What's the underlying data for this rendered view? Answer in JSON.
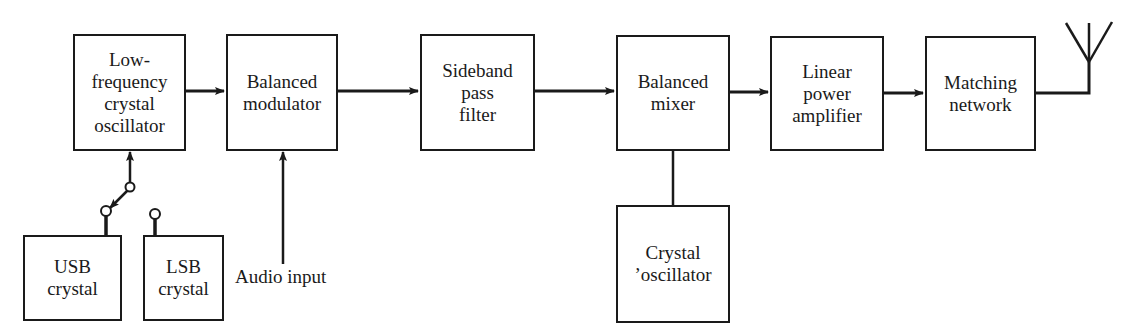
{
  "diagram": {
    "blocks": [
      {
        "id": "lf_osc",
        "lines": [
          "Low-",
          "frequency",
          "crystal",
          "oscillator"
        ]
      },
      {
        "id": "bal_mod",
        "lines": [
          "Balanced",
          "modulator"
        ]
      },
      {
        "id": "sb_filter",
        "lines": [
          "Sideband",
          "pass",
          "filter"
        ]
      },
      {
        "id": "bal_mixer",
        "lines": [
          "Balanced",
          "mixer"
        ]
      },
      {
        "id": "lin_amp",
        "lines": [
          "Linear",
          "power",
          "amplifier"
        ]
      },
      {
        "id": "match_net",
        "lines": [
          "Matching",
          "network"
        ]
      },
      {
        "id": "usb_crystal",
        "lines": [
          "USB",
          "crystal"
        ]
      },
      {
        "id": "lsb_crystal",
        "lines": [
          "LSB",
          "crystal"
        ]
      },
      {
        "id": "crystal_osc",
        "lines": [
          "Crystal",
          "’oscillator"
        ]
      }
    ],
    "labels": {
      "audio_input": "Audio input"
    },
    "connections": [
      {
        "from": "lf_osc",
        "to": "bal_mod",
        "arrow": true
      },
      {
        "from": "bal_mod",
        "to": "sb_filter",
        "arrow": true
      },
      {
        "from": "sb_filter",
        "to": "bal_mixer",
        "arrow": true
      },
      {
        "from": "bal_mixer",
        "to": "lin_amp",
        "arrow": true
      },
      {
        "from": "lin_amp",
        "to": "match_net",
        "arrow": true
      },
      {
        "from": "match_net",
        "to": "antenna",
        "arrow": false
      },
      {
        "from": "crystal_osc",
        "to": "bal_mixer",
        "arrow": false
      },
      {
        "from": "audio_input",
        "to": "bal_mod",
        "arrow": true
      },
      {
        "from": "switch",
        "to": "lf_osc",
        "arrow": true,
        "note": "switch selects USB crystal"
      }
    ],
    "colors": {
      "line": "#1a1a1a",
      "background": "#ffffff"
    }
  }
}
